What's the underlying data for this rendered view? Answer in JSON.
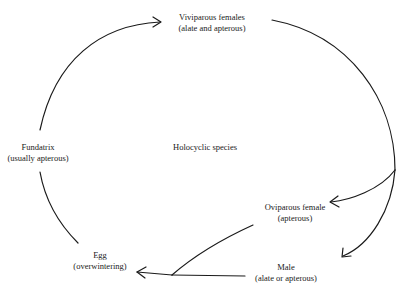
{
  "diagram": {
    "center_label": "Holocyclic species",
    "nodes": {
      "viviparous": {
        "title": "Viviparous females",
        "subtitle": "(alate and apterous)"
      },
      "fundatrix": {
        "title": "Fundatrix",
        "subtitle": "(usually apterous)"
      },
      "oviparous": {
        "title": "Oviparous female",
        "subtitle": "(apterous)"
      },
      "male": {
        "title": "Male",
        "subtitle": "(alate or apterous)"
      },
      "egg": {
        "title": "Egg",
        "subtitle": "(overwintering)"
      }
    },
    "edges": [
      {
        "from": "Fundatrix",
        "to": "Viviparous females"
      },
      {
        "from": "Viviparous females",
        "to": "Oviparous female"
      },
      {
        "from": "Viviparous females",
        "to": "Male"
      },
      {
        "from": "Oviparous female",
        "to": "Egg"
      },
      {
        "from": "Male",
        "to": "Egg"
      },
      {
        "from": "Egg",
        "to": "Fundatrix"
      }
    ],
    "colors": {
      "line": "#1a1a1a",
      "background": "#ffffff"
    }
  }
}
